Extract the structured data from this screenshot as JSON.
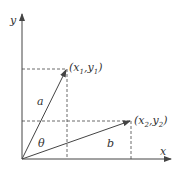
{
  "diagram": {
    "axes": {
      "x_label": "x",
      "y_label": "y"
    },
    "points": [
      {
        "label": "(x1,y1)",
        "x_name": "x",
        "x_sub": "1",
        "y_name": "y",
        "y_sub": "1"
      },
      {
        "label": "(x2,y2)",
        "x_name": "x",
        "x_sub": "2",
        "y_name": "y",
        "y_sub": "2"
      }
    ],
    "vectors": [
      {
        "name": "a",
        "from": "origin",
        "to": "(x1,y1)"
      },
      {
        "name": "b",
        "from": "origin",
        "to": "(x2,y2)"
      }
    ],
    "angle_label": "θ",
    "colors": {
      "line": "#444444",
      "background": "#ffffff"
    }
  }
}
